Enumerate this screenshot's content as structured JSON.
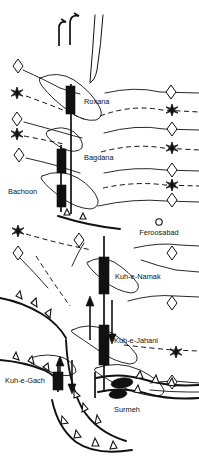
{
  "figure": {
    "kind": "structural-geology-sketch-map",
    "background_color": "#ffffff",
    "ink_color": "#111111",
    "width": 199,
    "height": 462
  },
  "labels": {
    "roxana": "Roxana",
    "bagdana": "Bagdana",
    "bachoon": "Bachoon",
    "feroosabad": "Feroosabad",
    "kuh_e_namak": "Kuh-e-Namak",
    "kuh_e_jahani": "Kuh-e-Jahani",
    "kuh_e_gach": "Kuh-e-Gach",
    "surmeh": "Surmeh"
  },
  "symbols": {
    "anticline_axis": "diamond-lozenge-on-solid-line",
    "syncline_axis": "asterisk-star-on-dashed-line",
    "thrust_fault": "open-triangle-teeth",
    "salt_plug": "black-filled-rectangle",
    "salt_dome": "black-filled-ellipse",
    "strike_slip": "paired-opposing-arrows",
    "town": "small-open-circle",
    "fold_plunge": "hooked-arrow"
  },
  "legend_text": {
    "anticline": "anticline axis",
    "syncline": "syncline axis",
    "thrust": "thrust fault",
    "salt": "salt plug / diapir",
    "town_marker": "town"
  }
}
